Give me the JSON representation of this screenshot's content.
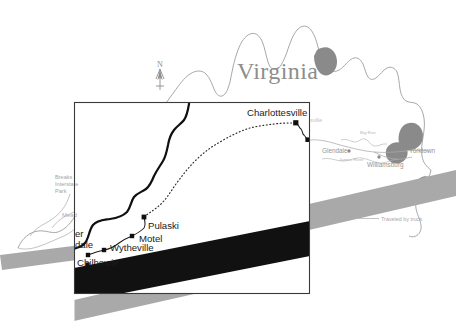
{
  "map": {
    "state_title": "Virginia",
    "compass": {
      "letter": "N",
      "name": "north-arrow"
    },
    "legend": {
      "traveled_by_truck": "Traveled by truck"
    },
    "colors": {
      "state_outline": "#9b9b9b",
      "water_fill": "#8a8a8a",
      "route_inset": "#101010",
      "truck_band_outer": "#a8a8a8",
      "truck_band_inset": "#111111",
      "inset_border": "#3a3a3a",
      "label_dark": "#1b1b1b",
      "label_faint": "#a5a5a5",
      "background": "#ffffff"
    },
    "outer_labels": [
      {
        "name": "breaks-interstate-park",
        "text": "Breaks\nInterstate\nPark",
        "lines": [
          "Breaks",
          "Interstate",
          "Park"
        ]
      },
      {
        "name": "meadows",
        "text": "Mead"
      },
      {
        "name": "glendale",
        "text": "Glendale"
      },
      {
        "name": "williamsburg",
        "text": "Williamsburg"
      },
      {
        "name": "yorktown",
        "text": "Yorktown"
      },
      {
        "name": "big-run-river",
        "text": "Big Run"
      },
      {
        "name": "james-river",
        "text": "James River"
      },
      {
        "name": "charlottesville-shadow",
        "text": "sville"
      }
    ],
    "inset_labels": [
      {
        "name": "charlottesville",
        "text": "Charlottesville"
      },
      {
        "name": "pulaski",
        "text": "Pulaski"
      },
      {
        "name": "motel",
        "text": "Motel"
      },
      {
        "name": "wytheville",
        "text": "Wytheville"
      },
      {
        "name": "chilhowie",
        "text": "Chilhowie"
      },
      {
        "name": "clipped-upper",
        "text": "er"
      },
      {
        "name": "clipped-lower",
        "text": "dale"
      }
    ]
  }
}
